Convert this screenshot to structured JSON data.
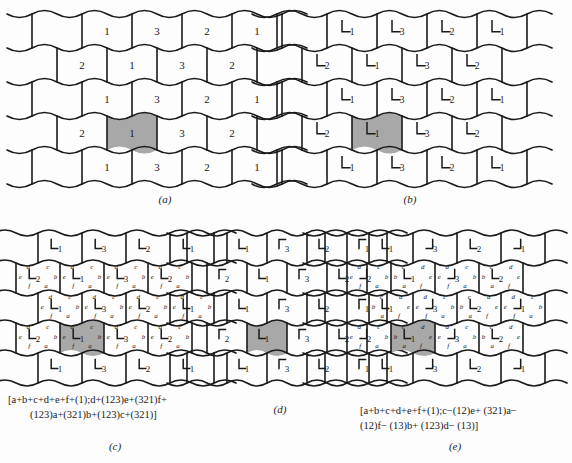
{
  "figure": {
    "background_color": "#fdfdfd",
    "line_color": "#1a1a1a",
    "shaded_cell_color": "#a8a8a8"
  },
  "panels": [
    {
      "id": "a",
      "label": "(a)",
      "glyph_type": "none",
      "marked_cell": {
        "row": 2,
        "col": 1,
        "number": "1"
      },
      "rows": [
        {
          "offset": "half",
          "numbers": [
            "1",
            "3",
            "2",
            "1"
          ]
        },
        {
          "offset": "none",
          "numbers": [
            "2",
            "1",
            "3",
            "2"
          ]
        },
        {
          "offset": "half",
          "numbers": [
            "1",
            "3",
            "2",
            "1"
          ]
        },
        {
          "offset": "none",
          "numbers": [
            "2",
            "1",
            "3",
            "2"
          ]
        },
        {
          "offset": "half",
          "numbers": [
            "1",
            "3",
            "2",
            "1"
          ]
        }
      ]
    },
    {
      "id": "b",
      "label": "(b)",
      "glyph_type": "L",
      "marked_cell": {
        "row": 2,
        "col": 1,
        "number": "1"
      },
      "rows": [
        {
          "offset": "half",
          "numbers": [
            "1",
            "3",
            "2",
            "1"
          ]
        },
        {
          "offset": "none",
          "numbers": [
            "2",
            "1",
            "3",
            "2"
          ]
        },
        {
          "offset": "half",
          "numbers": [
            "1",
            "3",
            "2",
            "1"
          ]
        },
        {
          "offset": "none",
          "numbers": [
            "2",
            "1",
            "3",
            "2"
          ]
        },
        {
          "offset": "half",
          "numbers": [
            "1",
            "3",
            "2",
            "1"
          ]
        }
      ]
    },
    {
      "id": "c",
      "label": "(c)",
      "glyph_type": "L",
      "marked_cell": {
        "row": 2,
        "col": 1,
        "number": "1"
      },
      "edge_letters": [
        "a",
        "b",
        "c",
        "d",
        "e",
        "f"
      ],
      "rows": [
        {
          "offset": "half",
          "numbers": [
            "1",
            "3",
            "2",
            "1"
          ]
        },
        {
          "offset": "none",
          "numbers": [
            "2",
            "1",
            "3",
            "2"
          ]
        },
        {
          "offset": "half",
          "numbers": [
            "1",
            "3",
            "2",
            "1"
          ]
        },
        {
          "offset": "none",
          "numbers": [
            "2",
            "1",
            "3",
            "2"
          ]
        },
        {
          "offset": "half",
          "numbers": [
            "1",
            "3",
            "2",
            "1"
          ]
        }
      ],
      "formula_lines": [
        "[a+b+c+d+e+f+(1);d+(123)e+(321)f+",
        "(123)a+(321)b+(123)c+(321)]"
      ]
    },
    {
      "id": "d",
      "label": "(d)",
      "glyph_type": "L-mixed",
      "marked_cell": {
        "row": 2,
        "col": 1,
        "number": "1"
      },
      "rows": [
        {
          "offset": "half",
          "numbers": [
            "1",
            "3",
            "2",
            "1"
          ]
        },
        {
          "offset": "none",
          "numbers": [
            "2",
            "1",
            "3",
            "2"
          ]
        },
        {
          "offset": "half",
          "numbers": [
            "1",
            "3",
            "2",
            "1"
          ]
        },
        {
          "offset": "none",
          "numbers": [
            "2",
            "1",
            "3",
            "2"
          ]
        },
        {
          "offset": "half",
          "numbers": [
            "1",
            "3",
            "2",
            "1"
          ]
        }
      ]
    },
    {
      "id": "e",
      "label": "(e)",
      "glyph_type": "L-mixed",
      "marked_cell": {
        "row": 2,
        "col": 1,
        "number": "1"
      },
      "edge_letters": [
        "a",
        "b",
        "c",
        "d",
        "e",
        "f"
      ],
      "rows": [
        {
          "offset": "half",
          "numbers": [
            "1",
            "3",
            "2",
            "1"
          ]
        },
        {
          "offset": "none",
          "numbers": [
            "2",
            "1",
            "3",
            "2"
          ]
        },
        {
          "offset": "half",
          "numbers": [
            "1",
            "3",
            "2",
            "1"
          ]
        },
        {
          "offset": "none",
          "numbers": [
            "2",
            "1",
            "3",
            "2"
          ]
        },
        {
          "offset": "half",
          "numbers": [
            "1",
            "3",
            "2",
            "1"
          ]
        }
      ],
      "formula_lines": [
        "[a+b+c+d+e+f+(1);c−(12)e+ (321)a−",
        "(12)f− (13)b+ (123)d− (13)]"
      ]
    }
  ]
}
